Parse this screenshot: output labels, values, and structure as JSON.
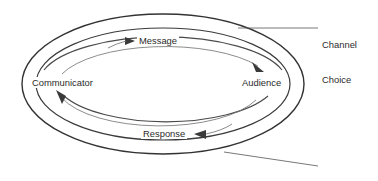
{
  "diagram": {
    "type": "concentric-ellipse-cycle",
    "background_color": "#ffffff",
    "line_color": "#3b3b3b",
    "text_color": "#2b2b2b",
    "nodes": [
      {
        "id": "communicator",
        "label": "Communicator",
        "x": 72,
        "y": 83
      },
      {
        "id": "audience",
        "label": "Audience",
        "x": 265,
        "y": 83
      }
    ],
    "flows": [
      {
        "id": "message",
        "label": "Message",
        "direction": "communicator-to-audience",
        "x": 163,
        "y": 41
      },
      {
        "id": "response",
        "label": "Response",
        "direction": "audience-to-communicator",
        "x": 167,
        "y": 134
      }
    ],
    "callouts": [
      {
        "id": "channel-choice",
        "line1": "Channel",
        "line2": "Choice",
        "target": "inner-ellipse",
        "leader_from_x": 238,
        "leader_from_y": 28,
        "leader_to_x": 318,
        "leader_to_y": 28
      },
      {
        "id": "culture",
        "line1": "Culture",
        "line2": "",
        "target": "outer-ellipse",
        "leader_from_x": 224,
        "leader_from_y": 152,
        "leader_to_x": 318,
        "leader_to_y": 166
      }
    ],
    "rings": [
      {
        "id": "outer-ellipse",
        "cx": 163,
        "cy": 84,
        "rx": 141,
        "ry": 70,
        "meaning": "Culture"
      },
      {
        "id": "inner-ellipse",
        "cx": 163,
        "cy": 84,
        "rx": 127,
        "ry": 56,
        "meaning": "Channel Choice"
      }
    ]
  }
}
